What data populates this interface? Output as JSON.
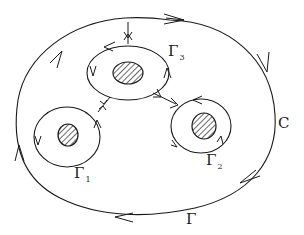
{
  "diagram": {
    "labels": {
      "outer_curve": "C",
      "outer_contour": "Γ",
      "loop1_main": "Γ",
      "loop1_sub": "1",
      "loop2_main": "Γ",
      "loop2_sub": "2",
      "loop3_main": "Γ",
      "loop3_sub": "3"
    },
    "elements": [
      {
        "name": "outer-contour",
        "type": "closed-curve",
        "orientation": "clockwise",
        "label": "C / Γ"
      },
      {
        "name": "loop-gamma-1",
        "type": "closed-curve",
        "orientation": "counterclockwise",
        "hole": "hatched"
      },
      {
        "name": "loop-gamma-2",
        "type": "closed-curve",
        "orientation": "counterclockwise",
        "hole": "hatched"
      },
      {
        "name": "loop-gamma-3",
        "type": "closed-curve",
        "orientation": "counterclockwise",
        "hole": "hatched"
      }
    ],
    "connectors": [
      {
        "from": "outer-contour",
        "to": "loop-gamma-3",
        "style": "double-arrow"
      },
      {
        "from": "loop-gamma-3",
        "to": "loop-gamma-1",
        "style": "double-arrow"
      },
      {
        "from": "loop-gamma-3",
        "to": "loop-gamma-2",
        "style": "double-arrow"
      }
    ]
  }
}
